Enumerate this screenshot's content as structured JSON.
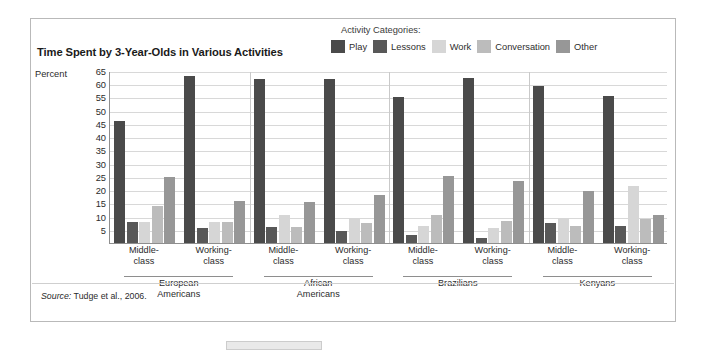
{
  "figure": {
    "title": "Time Spent by 3-Year-Olds in Various Activities",
    "percent_axis_label": "Percent",
    "source_prefix": "Source:",
    "source_text": " Tudge et al., 2006."
  },
  "legend": {
    "title": "Activity Categories:",
    "items": [
      {
        "label": "Play",
        "color": "#4a4a4a"
      },
      {
        "label": "Lessons",
        "color": "#585858"
      },
      {
        "label": "Work",
        "color": "#d6d6d6"
      },
      {
        "label": "Conversation",
        "color": "#bcbcbc"
      },
      {
        "label": "Other",
        "color": "#979797"
      }
    ]
  },
  "chart_data": {
    "type": "bar",
    "title": "Time Spent by 3-Year-Olds in Various Activities",
    "xlabel": "",
    "ylabel": "Percent",
    "ylim": [
      0,
      65
    ],
    "yticks": [
      5,
      10,
      15,
      20,
      25,
      30,
      35,
      40,
      45,
      50,
      55,
      60,
      65
    ],
    "grid": true,
    "legend_position": "top-right",
    "categories": [
      "European Americans / Middle-class",
      "European Americans / Working-class",
      "African Americans / Middle-class",
      "African Americans / Working-class",
      "Brazilians / Middle-class",
      "Brazilians / Working-class",
      "Kenyans / Middle-class",
      "Kenyans / Working-class"
    ],
    "groups": [
      {
        "name": "European Americans",
        "subgroups": [
          "Middle-\nclass",
          "Working-\nclass"
        ]
      },
      {
        "name": "African Americans",
        "subgroups": [
          "Middle-\nclass",
          "Working-\nclass"
        ]
      },
      {
        "name": "Brazilians",
        "subgroups": [
          "Middle-\nclass",
          "Working-\nclass"
        ]
      },
      {
        "name": "Kenyans",
        "subgroups": [
          "Middle-\nclass",
          "Working-\nclass"
        ]
      }
    ],
    "series": [
      {
        "name": "Play",
        "color": "#4a4a4a",
        "values": [
          46,
          63,
          62,
          62,
          55,
          62.5,
          59.5,
          55.5
        ]
      },
      {
        "name": "Lessons",
        "color": "#585858",
        "values": [
          8,
          5.5,
          6,
          4.5,
          3,
          2,
          7.5,
          6.5
        ]
      },
      {
        "name": "Work",
        "color": "#d6d6d6",
        "values": [
          8,
          8,
          10.5,
          9.5,
          6.5,
          5.5,
          9.5,
          21.5
        ]
      },
      {
        "name": "Conversation",
        "color": "#bcbcbc",
        "values": [
          14,
          8,
          6,
          7.5,
          10.5,
          8.5,
          6.5,
          9
        ]
      },
      {
        "name": "Other",
        "color": "#979797",
        "values": [
          25,
          16,
          15.5,
          18,
          25.5,
          23.5,
          19.5,
          10.5
        ]
      }
    ]
  }
}
